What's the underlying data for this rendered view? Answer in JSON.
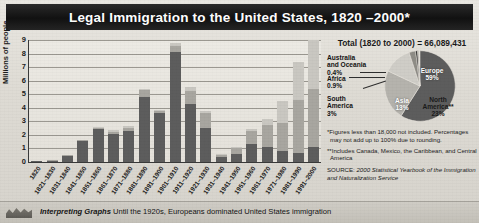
{
  "title": "Legal Immigration to the United States, 1820 –2000*",
  "chart_data": {
    "type": "bar",
    "title": "Legal Immigration to the United States, 1820 –2000*",
    "xlabel": "",
    "ylabel": "Millions of people",
    "ylim": [
      0,
      9
    ],
    "yticks": [
      "0",
      "1",
      "2",
      "3",
      "4",
      "5",
      "6",
      "7",
      "8",
      "9"
    ],
    "grid": true,
    "stacked": true,
    "categories": [
      "1820",
      "1821–1830",
      "1831–1840",
      "1841–1850",
      "1851–1860",
      "1861–1870",
      "1871–1880",
      "1881–1890",
      "1891–1900",
      "1901–1910",
      "1911–1920",
      "1921–1930",
      "1931–1940",
      "1941–1950",
      "1951–1960",
      "1961–1970",
      "1971–1980",
      "1981–1990",
      "1991–2000"
    ],
    "series": [
      {
        "name": "Europe",
        "values": [
          0.05,
          0.1,
          0.48,
          1.55,
          2.4,
          2.1,
          2.3,
          4.8,
          3.6,
          8.1,
          4.3,
          2.5,
          0.35,
          0.6,
          1.3,
          1.1,
          0.8,
          0.7,
          1.1
        ]
      },
      {
        "name": "Americas and other",
        "values": [
          0.0,
          0.01,
          0.05,
          0.05,
          0.1,
          0.15,
          0.2,
          0.5,
          0.15,
          0.45,
          0.95,
          1.1,
          0.15,
          0.4,
          1.0,
          1.6,
          2.1,
          3.9,
          4.3
        ]
      },
      {
        "name": "Asia",
        "values": [
          0.0,
          0.0,
          0.0,
          0.0,
          0.05,
          0.1,
          0.15,
          0.1,
          0.05,
          0.2,
          0.25,
          0.2,
          0.02,
          0.05,
          0.15,
          0.45,
          1.6,
          2.8,
          3.6
        ]
      }
    ],
    "bar_totals": [
      0.05,
      0.11,
      0.53,
      1.6,
      2.55,
      2.35,
      2.65,
      5.4,
      3.8,
      8.75,
      5.5,
      3.8,
      0.52,
      1.05,
      2.45,
      3.15,
      4.5,
      7.4,
      9.0
    ]
  },
  "pie": {
    "total_label": "Total (1820 to 2000) = 66,089,431",
    "slices": [
      {
        "label": "Europe",
        "value": "59%",
        "percent": 59
      },
      {
        "label": "North America**",
        "value": "23%",
        "percent": 23
      },
      {
        "label": "Asia",
        "value": "13%",
        "percent": 13
      },
      {
        "label": "South America",
        "value": "3%",
        "percent": 3
      },
      {
        "label": "Africa",
        "value": "0.9%",
        "percent": 0.9
      },
      {
        "label": "Australia and Oceania",
        "value": "0.4%",
        "percent": 0.4
      }
    ],
    "labels": {
      "europe": "Europe",
      "europe_pct": "59%",
      "north_america": "North",
      "north_america2": "America**",
      "north_america_pct": "23%",
      "asia": "Asia",
      "asia_pct": "13%",
      "australia1": "Australia",
      "australia2": "and Oceania",
      "australia_pct": "0.4%",
      "africa": "Africa",
      "africa_pct": "0.9%",
      "south1": "South",
      "south2": "America",
      "south_pct": "3%"
    }
  },
  "notes": {
    "footnote1": "*Figures less than 18,000 not included. Percentages may not add up to 100% due to rounding.",
    "footnote2": "**Includes Canada, Mexico, the Caribbean, and Central America",
    "source_prefix": "SOURCE: ",
    "source_title": "2000 Statistical Yearbook of the Immigration and Naturalization Service"
  },
  "caption": {
    "heading": "Interpreting Graphs",
    "text": "Until the 1920s, Europeans dominated United States immigration"
  },
  "colors": {
    "title_bar": "#111111",
    "europe": "#5d5d5d",
    "americas": "#a8a6a0",
    "asia": "#c9c7c1",
    "panel": "#dedbd4"
  }
}
